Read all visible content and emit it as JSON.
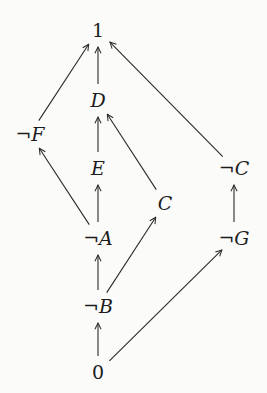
{
  "diagram": {
    "type": "hasse-diagram",
    "nodes": [
      {
        "id": "top",
        "label": "1",
        "italic": false,
        "x": 98,
        "y": 30
      },
      {
        "id": "D",
        "label": "D",
        "italic": true,
        "x": 98,
        "y": 100
      },
      {
        "id": "notF",
        "label": "¬F",
        "italic": true,
        "x": 30,
        "y": 134
      },
      {
        "id": "E",
        "label": "E",
        "italic": true,
        "x": 98,
        "y": 168
      },
      {
        "id": "notC",
        "label": "¬C",
        "italic": true,
        "x": 234,
        "y": 168
      },
      {
        "id": "C",
        "label": "C",
        "italic": true,
        "x": 165,
        "y": 203
      },
      {
        "id": "notA",
        "label": "¬A",
        "italic": true,
        "x": 98,
        "y": 238
      },
      {
        "id": "notG",
        "label": "¬G",
        "italic": true,
        "x": 234,
        "y": 238
      },
      {
        "id": "notB",
        "label": "¬B",
        "italic": true,
        "x": 98,
        "y": 306
      },
      {
        "id": "bottom",
        "label": "0",
        "italic": false,
        "x": 98,
        "y": 372
      }
    ],
    "edges": [
      {
        "from": "D",
        "to": "top"
      },
      {
        "from": "notF",
        "to": "top"
      },
      {
        "from": "notC",
        "to": "top"
      },
      {
        "from": "E",
        "to": "D"
      },
      {
        "from": "C",
        "to": "D"
      },
      {
        "from": "notA",
        "to": "notF"
      },
      {
        "from": "notA",
        "to": "E"
      },
      {
        "from": "notG",
        "to": "notC"
      },
      {
        "from": "notB",
        "to": "notA"
      },
      {
        "from": "notB",
        "to": "C"
      },
      {
        "from": "bottom",
        "to": "notB"
      },
      {
        "from": "bottom",
        "to": "notG"
      }
    ]
  }
}
